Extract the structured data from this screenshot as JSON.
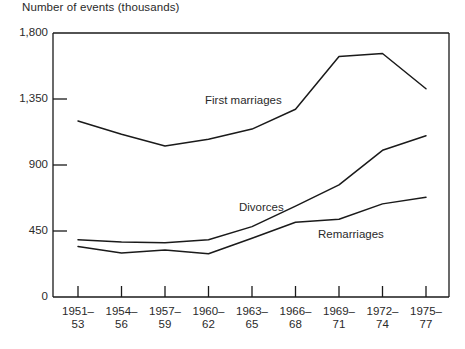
{
  "chart_data": {
    "type": "line",
    "title": "Number of events (thousands)",
    "xlabel": "",
    "ylabel": "Number of events (thousands)",
    "ylim": [
      0,
      1800
    ],
    "yticks": [
      0,
      450,
      900,
      1350,
      1800
    ],
    "ytick_labels": [
      "0",
      "450",
      "900",
      "1,350",
      "1,800"
    ],
    "grid": false,
    "legend_position": "inline-annotations",
    "categories": [
      "1951-53",
      "1954-56",
      "1957-59",
      "1960-62",
      "1963-65",
      "1966-68",
      "1969-71",
      "1972-74",
      "1975-77"
    ],
    "xtick_labels": [
      {
        "top": "1951–",
        "bottom": "53"
      },
      {
        "top": "1954–",
        "bottom": "56"
      },
      {
        "top": "1957–",
        "bottom": "59"
      },
      {
        "top": "1960–",
        "bottom": "62"
      },
      {
        "top": "1963–",
        "bottom": "65"
      },
      {
        "top": "1966–",
        "bottom": "68"
      },
      {
        "top": "1969–",
        "bottom": "71"
      },
      {
        "top": "1972–",
        "bottom": "74"
      },
      {
        "top": "1975–",
        "bottom": "77"
      }
    ],
    "series": [
      {
        "name": "First marriages",
        "label": "First marriages",
        "color": "#1a1a1a",
        "values": [
          1200,
          1110,
          1030,
          1075,
          1145,
          1280,
          1640,
          1660,
          1420
        ]
      },
      {
        "name": "Divorces",
        "label": "Divorces",
        "color": "#1a1a1a",
        "values": [
          390,
          375,
          370,
          390,
          480,
          620,
          765,
          1000,
          1100
        ]
      },
      {
        "name": "Remarriages",
        "label": "Remarriages",
        "color": "#1a1a1a",
        "values": [
          345,
          300,
          320,
          295,
          400,
          510,
          530,
          635,
          680
        ]
      }
    ],
    "annotations": [
      {
        "text": "First marriages",
        "x_px": 205,
        "y_px": 94
      },
      {
        "text": "Divorces",
        "x_px": 239,
        "y_px": 201
      },
      {
        "text": "Remarriages",
        "x_px": 318,
        "y_px": 228
      }
    ]
  },
  "axis": {
    "title": "Number of events (thousands)"
  }
}
